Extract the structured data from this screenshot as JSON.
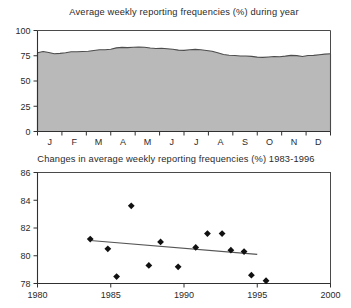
{
  "chart_data": [
    {
      "id": "top",
      "type": "area",
      "title": "Average weekly reporting frequencies (%) during year",
      "xlabel": "",
      "ylabel": "",
      "ylim": [
        0,
        100
      ],
      "yticks": [
        0,
        25,
        50,
        75,
        100
      ],
      "grid": false,
      "categories": [
        "J",
        "F",
        "M",
        "A",
        "M",
        "J",
        "J",
        "A",
        "S",
        "O",
        "N",
        "D"
      ],
      "x": [
        0.0,
        0.23,
        0.46,
        0.69,
        0.92,
        1.15,
        1.38,
        1.62,
        1.85,
        2.08,
        2.31,
        2.54,
        2.77,
        3.0,
        3.23,
        3.46,
        3.69,
        3.92,
        4.15,
        4.38,
        4.62,
        4.85,
        5.08,
        5.31,
        5.54,
        5.77,
        6.0,
        6.23,
        6.46,
        6.69,
        6.92,
        7.15,
        7.38,
        7.62,
        7.85,
        8.08,
        8.31,
        8.54,
        8.77,
        9.0,
        9.23,
        9.46,
        9.69,
        9.92,
        10.15,
        10.38,
        10.62,
        10.85,
        11.08,
        11.31,
        11.54,
        11.77,
        12.0
      ],
      "values": [
        78.0,
        79.2,
        78.3,
        77.0,
        77.4,
        78.0,
        79.0,
        79.0,
        79.2,
        79.5,
        80.2,
        81.0,
        81.0,
        81.5,
        82.8,
        83.3,
        83.0,
        83.4,
        83.7,
        83.4,
        82.6,
        82.2,
        82.4,
        82.0,
        81.4,
        80.6,
        80.3,
        81.0,
        81.3,
        81.0,
        80.2,
        79.5,
        78.0,
        76.2,
        75.5,
        75.2,
        74.8,
        74.8,
        74.4,
        73.6,
        73.4,
        73.8,
        74.2,
        74.0,
        74.6,
        75.4,
        75.1,
        74.3,
        75.2,
        75.4,
        76.0,
        76.6,
        77.0
      ],
      "area_color": "#b9b9b9",
      "line_color": "#4d4d4d"
    },
    {
      "id": "bottom",
      "type": "scatter",
      "title": "Changes in average weekly reporting frequencies (%) 1983-1996",
      "xlabel": "",
      "ylabel": "",
      "xlim": [
        1980,
        2000
      ],
      "ylim": [
        78,
        86
      ],
      "xticks": [
        1980,
        1985,
        1990,
        1995,
        2000
      ],
      "yticks": [
        78,
        80,
        82,
        84,
        86
      ],
      "grid": false,
      "marker": "diamond",
      "points": [
        {
          "x": 1983.6,
          "y": 81.2
        },
        {
          "x": 1984.8,
          "y": 80.5
        },
        {
          "x": 1985.4,
          "y": 78.5
        },
        {
          "x": 1986.4,
          "y": 83.6
        },
        {
          "x": 1987.6,
          "y": 79.3
        },
        {
          "x": 1988.4,
          "y": 81.0
        },
        {
          "x": 1989.6,
          "y": 79.2
        },
        {
          "x": 1990.8,
          "y": 80.6
        },
        {
          "x": 1991.6,
          "y": 81.6
        },
        {
          "x": 1992.6,
          "y": 81.6
        },
        {
          "x": 1993.2,
          "y": 80.4
        },
        {
          "x": 1994.1,
          "y": 80.3
        },
        {
          "x": 1994.6,
          "y": 78.6
        },
        {
          "x": 1995.6,
          "y": 78.2
        }
      ],
      "trend": {
        "x1": 1983.6,
        "y1": 81.1,
        "x2": 1995.0,
        "y2": 80.1
      },
      "marker_color": "#111111",
      "trend_color": "#555555"
    }
  ]
}
